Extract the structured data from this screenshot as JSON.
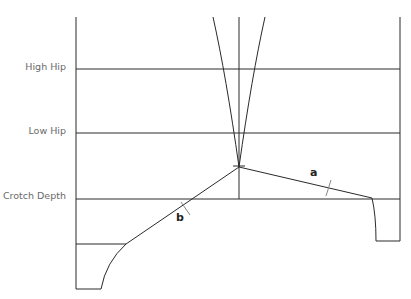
{
  "diagram": {
    "type": "pattern-draft",
    "levels": [
      {
        "label": "High Hip",
        "y": 69
      },
      {
        "label": "Low Hip",
        "y": 133
      },
      {
        "label": "Crotch Depth",
        "y": 199
      }
    ],
    "segment_labels": {
      "a": "a",
      "b": "b"
    },
    "colors": {
      "line": "#2a2a2a",
      "label": "#6a6a6a",
      "tick": "#888888"
    }
  }
}
